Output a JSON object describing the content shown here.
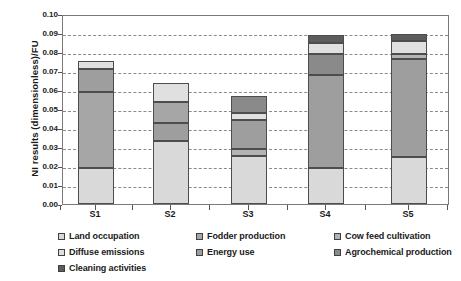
{
  "chart_data": {
    "type": "bar",
    "subtype": "stacked-bar",
    "title": "",
    "xlabel": "",
    "ylabel": "NI results (dimensionless)/FU",
    "ylim": [
      0.0,
      0.1
    ],
    "ytick_step": 0.01,
    "ytick_labels": [
      "0.10",
      "0.09",
      "0.08",
      "0.07",
      "0.06",
      "0.05",
      "0.04",
      "0.03",
      "0.02",
      "0.01",
      "0.00"
    ],
    "grid": true,
    "legend_position": "bottom",
    "categories": [
      "S1",
      "S2",
      "S3",
      "S4",
      "S5"
    ],
    "series": [
      {
        "name": "Land occupation",
        "color": "#d9d9d9",
        "values": [
          0.019,
          0.033,
          0.0255,
          0.019,
          0.0245
        ]
      },
      {
        "name": "Fodder production",
        "color": "#a6a6a6",
        "values": [
          0.04,
          0.0,
          0.0,
          0.0,
          0.0
        ]
      },
      {
        "name": "Cow feed cultivation",
        "color": "#b3b3b3",
        "values": [
          0.0,
          0.0,
          0.003,
          0.0,
          0.002
        ]
      },
      {
        "name": "Diffuse emissions",
        "color": "#9e9e9e",
        "values": [
          0.012,
          0.0095,
          0.0155,
          0.049,
          0.05
        ]
      },
      {
        "name": "Energy use",
        "color": "#e0e0e0",
        "values": [
          0.0045,
          0.021,
          0.004,
          0.006,
          0.007
        ]
      },
      {
        "name": "Agrochemical production",
        "color": "#8a8a8a",
        "values": [
          0.0,
          0.0,
          0.009,
          0.003,
          0.004
        ]
      },
      {
        "name": "Cleaning activities",
        "color": "#5c5c5c",
        "values": [
          0.0,
          0.0,
          0.0,
          0.012,
          0.002
        ]
      }
    ],
    "totals": [
      0.0755,
      0.0635,
      0.057,
      0.089,
      0.0895
    ],
    "stacks": [
      {
        "category": "S1",
        "segments": [
          {
            "series": "Land occupation",
            "from": 0.0,
            "to": 0.019,
            "color": "#d9d9d9"
          },
          {
            "series": "Fodder production",
            "from": 0.019,
            "to": 0.059,
            "color": "#a6a6a6"
          },
          {
            "series": "Diffuse emissions",
            "from": 0.059,
            "to": 0.071,
            "color": "#9e9e9e"
          },
          {
            "series": "Energy use",
            "from": 0.071,
            "to": 0.0755,
            "color": "#e0e0e0"
          }
        ]
      },
      {
        "category": "S2",
        "segments": [
          {
            "series": "Land occupation",
            "from": 0.0,
            "to": 0.033,
            "color": "#d9d9d9"
          },
          {
            "series": "Diffuse emissions",
            "from": 0.033,
            "to": 0.0425,
            "color": "#9e9e9e"
          },
          {
            "series": "Fodder production",
            "from": 0.0425,
            "to": 0.0535,
            "color": "#a6a6a6"
          },
          {
            "series": "Energy use",
            "from": 0.0535,
            "to": 0.0635,
            "color": "#e0e0e0"
          }
        ]
      },
      {
        "category": "S3",
        "segments": [
          {
            "series": "Land occupation",
            "from": 0.0,
            "to": 0.0255,
            "color": "#d9d9d9"
          },
          {
            "series": "Cow feed cultivation",
            "from": 0.0255,
            "to": 0.029,
            "color": "#b3b3b3"
          },
          {
            "series": "Diffuse emissions",
            "from": 0.029,
            "to": 0.044,
            "color": "#9e9e9e"
          },
          {
            "series": "Energy use",
            "from": 0.044,
            "to": 0.048,
            "color": "#e0e0e0"
          },
          {
            "series": "Agrochemical production",
            "from": 0.048,
            "to": 0.057,
            "color": "#8a8a8a"
          }
        ]
      },
      {
        "category": "S4",
        "segments": [
          {
            "series": "Land occupation",
            "from": 0.0,
            "to": 0.019,
            "color": "#d9d9d9"
          },
          {
            "series": "Diffuse emissions",
            "from": 0.019,
            "to": 0.068,
            "color": "#9e9e9e"
          },
          {
            "series": "Agrochemical production",
            "from": 0.068,
            "to": 0.079,
            "color": "#8a8a8a"
          },
          {
            "series": "Energy use",
            "from": 0.079,
            "to": 0.085,
            "color": "#e0e0e0"
          },
          {
            "series": "Cleaning activities",
            "from": 0.085,
            "to": 0.089,
            "color": "#5c5c5c"
          }
        ]
      },
      {
        "category": "S5",
        "segments": [
          {
            "series": "Land occupation",
            "from": 0.0,
            "to": 0.0245,
            "color": "#d9d9d9"
          },
          {
            "series": "Diffuse emissions",
            "from": 0.0245,
            "to": 0.0765,
            "color": "#9e9e9e"
          },
          {
            "series": "Cow feed cultivation",
            "from": 0.0765,
            "to": 0.079,
            "color": "#b3b3b3"
          },
          {
            "series": "Energy use",
            "from": 0.079,
            "to": 0.086,
            "color": "#e0e0e0"
          },
          {
            "series": "Cleaning activities",
            "from": 0.086,
            "to": 0.0895,
            "color": "#5c5c5c"
          }
        ]
      }
    ]
  },
  "legend": {
    "items": [
      {
        "label": "Land occupation",
        "color": "#d9d9d9"
      },
      {
        "label": "Fodder production",
        "color": "#a6a6a6"
      },
      {
        "label": "Cow feed cultivation",
        "color": "#b3b3b3"
      },
      {
        "label": "Diffuse emissions",
        "color": "#e0e0e0"
      },
      {
        "label": "Energy use",
        "color": "#9e9e9e"
      },
      {
        "label": "Agrochemical production",
        "color": "#8a8a8a"
      },
      {
        "label": "Cleaning activities",
        "color": "#5c5c5c"
      }
    ]
  }
}
